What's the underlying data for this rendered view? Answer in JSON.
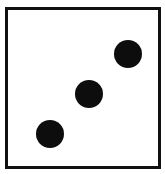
{
  "die": {
    "face_value": 3,
    "border_color": "#111111",
    "pip_color": "#0d0d0d",
    "background": "#ffffff",
    "pips": [
      {
        "label": "top-right",
        "cx": 122,
        "cy": 47
      },
      {
        "label": "center",
        "cx": 84,
        "cy": 87
      },
      {
        "label": "bottom-left",
        "cx": 45,
        "cy": 127
      }
    ]
  }
}
